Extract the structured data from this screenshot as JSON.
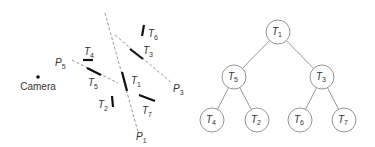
{
  "scene": {
    "camera": {
      "label": "Camera",
      "x": 38,
      "y": 77
    },
    "planes": [
      {
        "id": "P5",
        "base": "P",
        "sub": "5",
        "x1": 72,
        "y1": 60,
        "x2": 118,
        "y2": 83,
        "lx": 55,
        "ly": 66
      },
      {
        "id": "P1",
        "base": "P",
        "sub": "1",
        "x1": 105,
        "y1": 13,
        "x2": 138,
        "y2": 132,
        "lx": 136,
        "ly": 140
      },
      {
        "id": "P3",
        "base": "P",
        "sub": "3",
        "x1": 115,
        "y1": 35,
        "x2": 172,
        "y2": 83,
        "lx": 173,
        "ly": 92
      }
    ],
    "segments": [
      {
        "id": "T4",
        "base": "T",
        "sub": "4",
        "x1": 83,
        "y1": 60,
        "x2": 93,
        "y2": 60,
        "lx": 84,
        "ly": 55
      },
      {
        "id": "T5",
        "base": "T",
        "sub": "5",
        "x1": 87,
        "y1": 68,
        "x2": 101,
        "y2": 75,
        "lx": 88,
        "ly": 86
      },
      {
        "id": "T1",
        "base": "T",
        "sub": "1",
        "x1": 122,
        "y1": 72,
        "x2": 127,
        "y2": 91,
        "lx": 131,
        "ly": 84
      },
      {
        "id": "T3",
        "base": "T",
        "sub": "3",
        "x1": 130,
        "y1": 49,
        "x2": 143,
        "y2": 59,
        "lx": 143,
        "ly": 54
      },
      {
        "id": "T6",
        "base": "T",
        "sub": "6",
        "x1": 144,
        "y1": 25,
        "x2": 142,
        "y2": 36,
        "lx": 148,
        "ly": 37
      },
      {
        "id": "T2",
        "base": "T",
        "sub": "2",
        "x1": 112,
        "y1": 96,
        "x2": 113,
        "y2": 107,
        "lx": 98,
        "ly": 108
      },
      {
        "id": "T7",
        "base": "T",
        "sub": "7",
        "x1": 139,
        "y1": 95,
        "x2": 155,
        "y2": 101,
        "lx": 142,
        "ly": 114
      }
    ]
  },
  "tree": {
    "radius": 12,
    "nodes": [
      {
        "id": "T1",
        "base": "T",
        "sub": "1",
        "x": 278,
        "y": 32
      },
      {
        "id": "T5",
        "base": "T",
        "sub": "5",
        "x": 234,
        "y": 77
      },
      {
        "id": "T3",
        "base": "T",
        "sub": "3",
        "x": 322,
        "y": 77
      },
      {
        "id": "T4",
        "base": "T",
        "sub": "4",
        "x": 212,
        "y": 120
      },
      {
        "id": "T2",
        "base": "T",
        "sub": "2",
        "x": 257,
        "y": 120
      },
      {
        "id": "T6",
        "base": "T",
        "sub": "6",
        "x": 300,
        "y": 120
      },
      {
        "id": "T7",
        "base": "T",
        "sub": "7",
        "x": 344,
        "y": 120
      }
    ],
    "edges": [
      [
        "T1",
        "T5"
      ],
      [
        "T1",
        "T3"
      ],
      [
        "T5",
        "T4"
      ],
      [
        "T5",
        "T2"
      ],
      [
        "T3",
        "T6"
      ],
      [
        "T3",
        "T7"
      ]
    ]
  }
}
